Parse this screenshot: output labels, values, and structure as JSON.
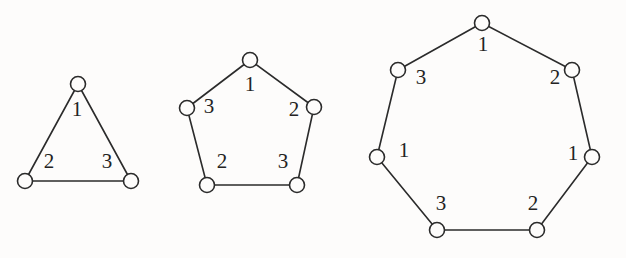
{
  "figure": {
    "background_color": "#fdfcfb",
    "stroke_color": "#2b2b2b",
    "label_color": "#232323",
    "vertex_fill": "#fdfcfb",
    "vertex_radius": 7.5,
    "stroke_width": 1.6,
    "label_font_size": 21
  },
  "polygons": [
    {
      "id": "triangle",
      "name": "triangle",
      "sides": 3,
      "caption": "",
      "vertices": [
        {
          "name": "triangle-vertex-top",
          "cx": 78,
          "cy": 84
        },
        {
          "name": "triangle-vertex-bottom-right",
          "cx": 131,
          "cy": 181
        },
        {
          "name": "triangle-vertex-bottom-left",
          "cx": 25,
          "cy": 181
        }
      ],
      "edges": [
        {
          "name": "triangle-edge-1",
          "from": 0,
          "to": 1,
          "label": "1",
          "label_x": 77,
          "label_y": 111
        },
        {
          "name": "triangle-edge-2",
          "from": 1,
          "to": 2,
          "label": "3",
          "label_x": 107,
          "label_y": 163
        },
        {
          "name": "triangle-edge-3",
          "from": 2,
          "to": 0,
          "label": "2",
          "label_x": 49,
          "label_y": 163
        }
      ],
      "labels": [
        "1",
        "3",
        "2"
      ]
    },
    {
      "id": "pentagon",
      "name": "pentagon",
      "sides": 5,
      "caption": "",
      "vertices": [
        {
          "name": "pentagon-vertex-top",
          "cx": 250,
          "cy": 60
        },
        {
          "name": "pentagon-vertex-right",
          "cx": 314,
          "cy": 107
        },
        {
          "name": "pentagon-vertex-bottom-right",
          "cx": 297,
          "cy": 185
        },
        {
          "name": "pentagon-vertex-bottom-left",
          "cx": 207,
          "cy": 185
        },
        {
          "name": "pentagon-vertex-left",
          "cx": 187,
          "cy": 108
        }
      ],
      "edges": [
        {
          "name": "pentagon-edge-1",
          "from": 0,
          "to": 1,
          "label": "1",
          "label_x": 250,
          "label_y": 86
        },
        {
          "name": "pentagon-edge-2",
          "from": 1,
          "to": 2,
          "label": "2",
          "label_x": 294,
          "label_y": 111
        },
        {
          "name": "pentagon-edge-3",
          "from": 2,
          "to": 3,
          "label": "3",
          "label_x": 283,
          "label_y": 163
        },
        {
          "name": "pentagon-edge-4",
          "from": 3,
          "to": 4,
          "label": "2",
          "label_x": 222,
          "label_y": 163
        },
        {
          "name": "pentagon-edge-5",
          "from": 4,
          "to": 0,
          "label": "3",
          "label_x": 209,
          "label_y": 108
        }
      ],
      "labels": [
        "1",
        "2",
        "3",
        "2",
        "3"
      ]
    },
    {
      "id": "heptagon",
      "name": "heptagon",
      "sides": 7,
      "caption": "",
      "vertices": [
        {
          "name": "heptagon-vertex-top",
          "cx": 482,
          "cy": 23
        },
        {
          "name": "heptagon-vertex-upper-right",
          "cx": 572,
          "cy": 70
        },
        {
          "name": "heptagon-vertex-right",
          "cx": 592,
          "cy": 157
        },
        {
          "name": "heptagon-vertex-lower-right",
          "cx": 537,
          "cy": 230
        },
        {
          "name": "heptagon-vertex-lower-left",
          "cx": 437,
          "cy": 230
        },
        {
          "name": "heptagon-vertex-left",
          "cx": 377,
          "cy": 157
        },
        {
          "name": "heptagon-vertex-upper-left",
          "cx": 398,
          "cy": 70
        }
      ],
      "edges": [
        {
          "name": "heptagon-edge-1",
          "from": 0,
          "to": 1,
          "label": "1",
          "label_x": 483,
          "label_y": 46
        },
        {
          "name": "heptagon-edge-2",
          "from": 1,
          "to": 2,
          "label": "2",
          "label_x": 555,
          "label_y": 79
        },
        {
          "name": "heptagon-edge-3",
          "from": 2,
          "to": 3,
          "label": "1",
          "label_x": 573,
          "label_y": 155
        },
        {
          "name": "heptagon-edge-4",
          "from": 3,
          "to": 4,
          "label": "2",
          "label_x": 533,
          "label_y": 205
        },
        {
          "name": "heptagon-edge-5",
          "from": 4,
          "to": 5,
          "label": "3",
          "label_x": 441,
          "label_y": 205
        },
        {
          "name": "heptagon-edge-6",
          "from": 5,
          "to": 6,
          "label": "1",
          "label_x": 404,
          "label_y": 152
        },
        {
          "name": "heptagon-edge-7",
          "from": 6,
          "to": 0,
          "label": "3",
          "label_x": 421,
          "label_y": 79
        }
      ],
      "labels": [
        "1",
        "2",
        "1",
        "2",
        "3",
        "1",
        "3"
      ]
    }
  ]
}
